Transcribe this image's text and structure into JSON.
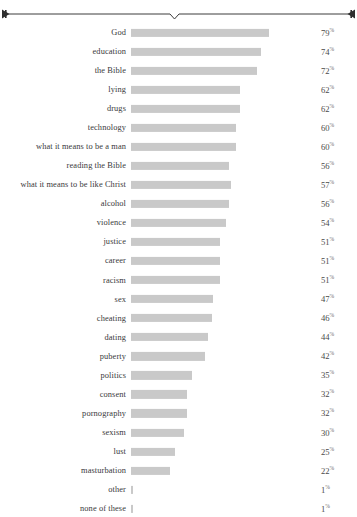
{
  "ornament": {
    "name": "decorative-divider-rule",
    "style": "horizontal rule with center notch and dart end caps",
    "color": "#3c3c3c"
  },
  "chart_data": {
    "type": "bar",
    "orientation": "horizontal",
    "title": "",
    "subtitle": "",
    "xlabel": "",
    "ylabel": "",
    "xlim": [
      0,
      100
    ],
    "grid": false,
    "legend": false,
    "value_suffix": "%",
    "bar_color": "#c9c9c9",
    "categories": [
      "God",
      "education",
      "the Bible",
      "lying",
      "drugs",
      "technology",
      "what it means to be a man",
      "reading the Bible",
      "what it means to be like Christ",
      "alcohol",
      "violence",
      "justice",
      "career",
      "racism",
      "sex",
      "cheating",
      "dating",
      "puberty",
      "politics",
      "consent",
      "pornography",
      "sexism",
      "lust",
      "masturbation",
      "other",
      "none of these"
    ],
    "values": [
      79,
      74,
      72,
      62,
      62,
      60,
      60,
      56,
      57,
      56,
      54,
      51,
      51,
      51,
      47,
      46,
      44,
      42,
      35,
      32,
      32,
      30,
      25,
      22,
      1,
      1
    ],
    "value_labels": [
      "79",
      "74",
      "72",
      "62",
      "62",
      "60",
      "60",
      "56",
      "57",
      "56",
      "54",
      "51",
      "51",
      "51",
      "47",
      "46",
      "44",
      "42",
      "35",
      "32",
      "32",
      "30",
      "25",
      "22",
      "1",
      "1"
    ],
    "percent_symbol": "%"
  }
}
